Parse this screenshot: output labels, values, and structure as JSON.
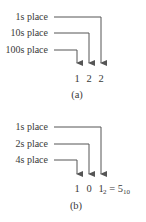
{
  "figure_a": {
    "labels": [
      "1s place",
      "10s place",
      "100s place"
    ],
    "digits": [
      "1",
      "2",
      "2"
    ],
    "caption": "(a)"
  },
  "figure_b": {
    "labels": [
      "1s place",
      "2s place",
      "4s place"
    ],
    "digits": [
      "1",
      "0",
      "1"
    ],
    "last_digit_subscript": "2",
    "equals": "=",
    "result_value": "5",
    "result_subscript": "10",
    "caption": "(b)"
  },
  "colors": {
    "line": "#555555",
    "text": "#3a3a3a"
  }
}
